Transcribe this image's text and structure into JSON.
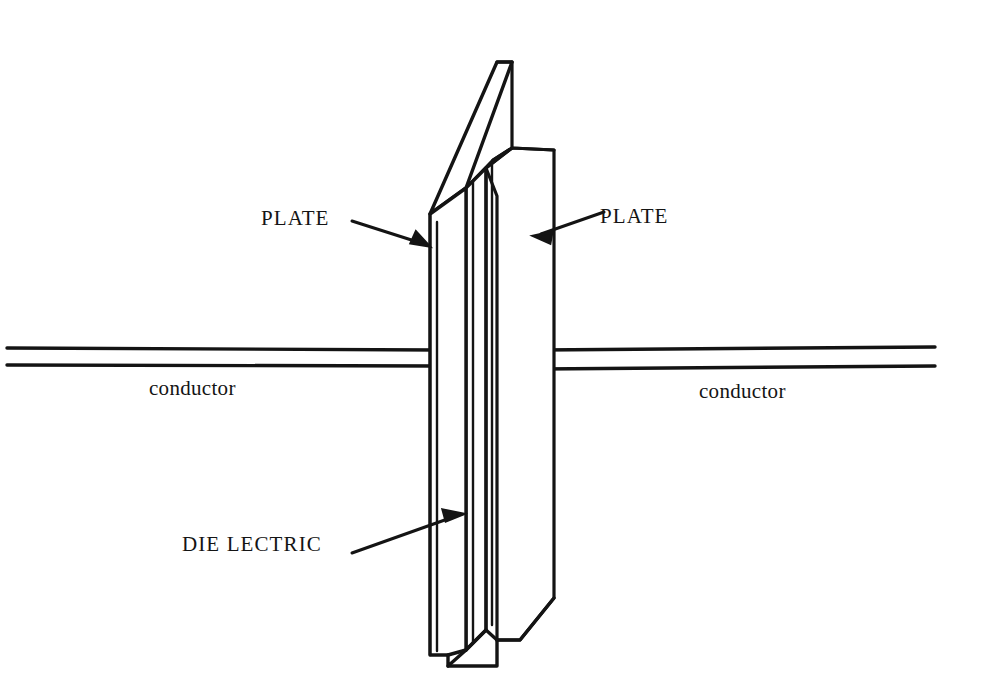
{
  "figure": {
    "background_color": "#ffffff",
    "ink_color": "#141414"
  },
  "labels": {
    "plate_left": "PLATE",
    "plate_right": "PLATE",
    "dielectric": "DIE LECTRIC",
    "conductor_left": "conductor",
    "conductor_right": "conductor"
  },
  "annotations": [
    {
      "name": "plate-left-leader",
      "text": "PLATE",
      "points_to": "front-plate-left-edge",
      "from": [
        352,
        221
      ],
      "to": [
        429,
        246
      ]
    },
    {
      "name": "plate-right-leader",
      "text": "PLATE",
      "points_to": "back-plate-face",
      "from": [
        604,
        212
      ],
      "to": [
        534,
        236
      ]
    },
    {
      "name": "dielectric-leader",
      "text": "DIE LECTRIC",
      "points_to": "middle-dielectric-layer",
      "from": [
        352,
        553
      ],
      "to": [
        463,
        514
      ]
    }
  ],
  "parts": {
    "front_plate": "front conductive plate",
    "dielectric_layer": "dielectric slab between plates",
    "back_plate": "rear conductive plate",
    "conductor_left": "lead wire attached to front plate",
    "conductor_right": "lead wire attached to rear plate"
  }
}
